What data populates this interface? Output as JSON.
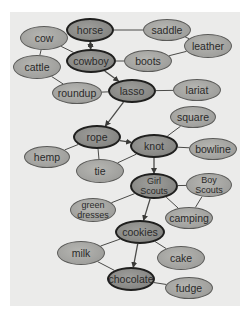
{
  "diagram": {
    "type": "semantic-network",
    "nodes": [
      {
        "id": "horse",
        "label": "horse",
        "key": true,
        "cx": 90,
        "cy": 30,
        "w": 48,
        "h": 24
      },
      {
        "id": "saddle",
        "label": "saddle",
        "key": false,
        "cx": 167,
        "cy": 30,
        "w": 48,
        "h": 22
      },
      {
        "id": "cow",
        "label": "cow",
        "key": false,
        "cx": 44,
        "cy": 38,
        "w": 48,
        "h": 24
      },
      {
        "id": "leather",
        "label": "leather",
        "key": false,
        "cx": 208,
        "cy": 46,
        "w": 48,
        "h": 24
      },
      {
        "id": "cattle",
        "label": "cattle",
        "key": false,
        "cx": 37,
        "cy": 67,
        "w": 48,
        "h": 24
      },
      {
        "id": "cowboy",
        "label": "cowboy",
        "key": true,
        "cx": 91,
        "cy": 61,
        "w": 50,
        "h": 24
      },
      {
        "id": "boots",
        "label": "boots",
        "key": false,
        "cx": 148,
        "cy": 61,
        "w": 48,
        "h": 22
      },
      {
        "id": "roundup",
        "label": "roundup",
        "key": false,
        "cx": 77,
        "cy": 93,
        "w": 50,
        "h": 22
      },
      {
        "id": "lasso",
        "label": "lasso",
        "key": true,
        "cx": 132,
        "cy": 91,
        "w": 48,
        "h": 24
      },
      {
        "id": "lariat",
        "label": "lariat",
        "key": false,
        "cx": 197,
        "cy": 90,
        "w": 48,
        "h": 22
      },
      {
        "id": "square",
        "label": "square",
        "key": false,
        "cx": 193,
        "cy": 117,
        "w": 46,
        "h": 22
      },
      {
        "id": "rope",
        "label": "rope",
        "key": true,
        "cx": 97,
        "cy": 137,
        "w": 48,
        "h": 24
      },
      {
        "id": "knot",
        "label": "knot",
        "key": true,
        "cx": 154,
        "cy": 146,
        "w": 48,
        "h": 24
      },
      {
        "id": "hemp",
        "label": "hemp",
        "key": false,
        "cx": 47,
        "cy": 157,
        "w": 46,
        "h": 22
      },
      {
        "id": "bowline",
        "label": "bowline",
        "key": false,
        "cx": 213,
        "cy": 149,
        "w": 48,
        "h": 22
      },
      {
        "id": "tie",
        "label": "tie",
        "key": false,
        "cx": 100,
        "cy": 171,
        "w": 48,
        "h": 24
      },
      {
        "id": "girl-scouts",
        "label_lines": [
          "Girl",
          "Scouts"
        ],
        "key": true,
        "cx": 154,
        "cy": 186,
        "w": 48,
        "h": 26
      },
      {
        "id": "boy-scouts",
        "label_lines": [
          "Boy",
          "Scouts"
        ],
        "key": false,
        "cx": 209,
        "cy": 185,
        "w": 46,
        "h": 24
      },
      {
        "id": "green-dresses",
        "label_lines": [
          "green",
          "dresses"
        ],
        "key": false,
        "cx": 93,
        "cy": 210,
        "w": 46,
        "h": 24
      },
      {
        "id": "camping",
        "label": "camping",
        "key": false,
        "cx": 189,
        "cy": 218,
        "w": 48,
        "h": 22
      },
      {
        "id": "cookies",
        "label": "cookies",
        "key": true,
        "cx": 140,
        "cy": 232,
        "w": 50,
        "h": 24
      },
      {
        "id": "milk",
        "label": "milk",
        "key": false,
        "cx": 81,
        "cy": 253,
        "w": 48,
        "h": 24
      },
      {
        "id": "cake",
        "label": "cake",
        "key": false,
        "cx": 181,
        "cy": 258,
        "w": 48,
        "h": 24
      },
      {
        "id": "chocolate",
        "label": "chocolate",
        "key": true,
        "cx": 131,
        "cy": 279,
        "w": 48,
        "h": 24
      },
      {
        "id": "fudge",
        "label": "fudge",
        "key": false,
        "cx": 189,
        "cy": 288,
        "w": 48,
        "h": 22
      }
    ],
    "edges": [
      {
        "from": "horse",
        "to": "saddle",
        "arrow": false
      },
      {
        "from": "horse",
        "to": "cow",
        "arrow": false
      },
      {
        "from": "cowboy",
        "to": "horse",
        "arrow": true,
        "bidirectional": true
      },
      {
        "from": "saddle",
        "to": "leather",
        "arrow": false
      },
      {
        "from": "boots",
        "to": "leather",
        "arrow": false
      },
      {
        "from": "cow",
        "to": "cattle",
        "arrow": false
      },
      {
        "from": "cow",
        "to": "cowboy",
        "arrow": false
      },
      {
        "from": "cowboy",
        "to": "boots",
        "arrow": false
      },
      {
        "from": "cattle",
        "to": "roundup",
        "arrow": false
      },
      {
        "from": "cowboy",
        "to": "lasso",
        "arrow": true
      },
      {
        "from": "roundup",
        "to": "lasso",
        "arrow": false
      },
      {
        "from": "lasso",
        "to": "lariat",
        "arrow": false
      },
      {
        "from": "lasso",
        "to": "rope",
        "arrow": true
      },
      {
        "from": "rope",
        "to": "knot",
        "arrow": true
      },
      {
        "from": "rope",
        "to": "hemp",
        "arrow": false
      },
      {
        "from": "rope",
        "to": "tie",
        "arrow": false
      },
      {
        "from": "knot",
        "to": "square",
        "arrow": false
      },
      {
        "from": "knot",
        "to": "bowline",
        "arrow": false
      },
      {
        "from": "knot",
        "to": "tie",
        "arrow": false
      },
      {
        "from": "knot",
        "to": "girl-scouts",
        "arrow": true
      },
      {
        "from": "girl-scouts",
        "to": "boy-scouts",
        "arrow": false
      },
      {
        "from": "girl-scouts",
        "to": "green-dresses",
        "arrow": false
      },
      {
        "from": "girl-scouts",
        "to": "camping",
        "arrow": false
      },
      {
        "from": "boy-scouts",
        "to": "camping",
        "arrow": false
      },
      {
        "from": "girl-scouts",
        "to": "cookies",
        "arrow": true
      },
      {
        "from": "cookies",
        "to": "milk",
        "arrow": false
      },
      {
        "from": "cookies",
        "to": "cake",
        "arrow": false
      },
      {
        "from": "cookies",
        "to": "chocolate",
        "arrow": true
      },
      {
        "from": "milk",
        "to": "chocolate",
        "arrow": false
      },
      {
        "from": "chocolate",
        "to": "fudge",
        "arrow": false
      }
    ]
  },
  "colors": {
    "panel_bg": "#ebebea",
    "node_fill": "#a3a3a0",
    "key_node_fill": "#8a8a87",
    "edge": "#4a4a48",
    "text": "#2a2a2a"
  }
}
